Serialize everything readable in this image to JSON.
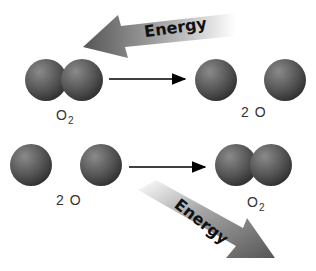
{
  "top": {
    "energy_label": "Energy",
    "left_label": "O",
    "left_sub": "2",
    "right_label": "2 O"
  },
  "bottom": {
    "energy_label": "Energy",
    "left_label": "2 O",
    "right_label": "O",
    "right_sub": "2"
  },
  "colors": {
    "atom": "#5a5a5a",
    "arrow": "#000000"
  }
}
